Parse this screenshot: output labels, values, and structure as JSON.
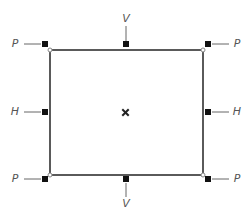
{
  "diagram": {
    "title": "",
    "colors": {
      "frame": "#5a5a5a",
      "handle": "#111111",
      "leader": "#666666",
      "label": "#555555",
      "corner_dot": "#888888"
    },
    "frame": {
      "x": 50,
      "y": 50,
      "width": 153,
      "height": 125
    },
    "center_marker": {
      "symbol": "×",
      "x": 125,
      "y": 112
    },
    "labels": {
      "top_left": "P",
      "top_right": "P",
      "bottom_left": "P",
      "bottom_right": "P",
      "left_middle": "H",
      "right_middle": "H",
      "top_middle": "V",
      "bottom_middle": "V"
    }
  }
}
